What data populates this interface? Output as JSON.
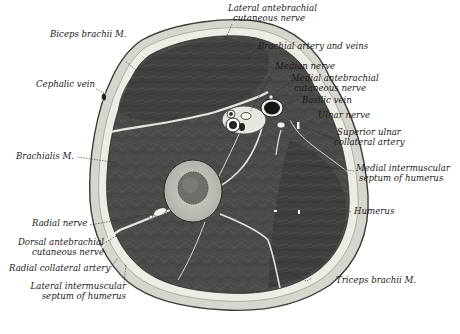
{
  "figure": {
    "colors": {
      "background": "#ffffff",
      "skin": "#d8d8d0",
      "fascia": "#efefe8",
      "muscle": "#4a4a48",
      "muscle_dark": "#2e2e2c",
      "bone_cortex": "#bdbdb6",
      "marrow": "#6a6a66",
      "septum": "#e4e4dc",
      "vessel_lumen": "#111111",
      "leader": "#222222"
    }
  },
  "labels": {
    "biceps_brachii": "Biceps brachii M.",
    "lateral_antebrachial_1": "Lateral antebrachial",
    "lateral_antebrachial_2": "cutaneous nerve",
    "brachial_artery": "Brachial artery and veins",
    "median_nerve": "Median nerve",
    "medial_antebrachial_1": "Medial antebrachial",
    "medial_antebrachial_2": "cutaneous nerve",
    "basilic_vein": "Basilic vein",
    "cephalic_vein": "Cephalic vein",
    "ulnar_nerve": "Ulnar nerve",
    "superior_ulnar_1": "Superior ulnar",
    "superior_ulnar_2": "collateral artery",
    "brachialis": "Brachialis M.",
    "medial_septum_1": "Medial intermuscular",
    "medial_septum_2": "septum of humerus",
    "humerus": "Humerus",
    "radial_nerve": "Radial nerve",
    "dorsal_antebrachial_1": "Dorsal antebrachial",
    "dorsal_antebrachial_2": "cutaneous nerve",
    "radial_collateral": "Radial collateral artery",
    "lateral_septum_1": "Lateral intermuscular",
    "lateral_septum_2": "septum of humerus",
    "triceps_brachii": "Triceps brachii M."
  }
}
